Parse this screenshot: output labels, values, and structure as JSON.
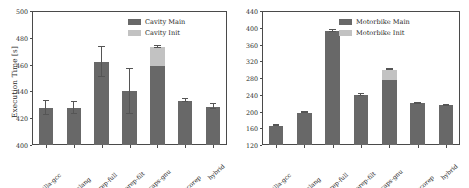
{
  "figure": {
    "panels": [
      {
        "id": "cavity",
        "ylabel": "Execution Time [s]",
        "legend": [
          {
            "label": "Cavity Main",
            "color": "#686868",
            "icon": "legend-swatch-main"
          },
          {
            "label": "Cavity Init",
            "color": "#c2c2c2",
            "icon": "legend-swatch-init"
          }
        ],
        "chart_data": {
          "type": "bar",
          "title": "",
          "xlabel": "",
          "ylabel": "Execution Time [s]",
          "ylim": [
            400,
            500
          ],
          "yticks": [
            400,
            420,
            440,
            460,
            480,
            500
          ],
          "grid": false,
          "legend_position": "upper right",
          "stacked": true,
          "categories": [
            "vanilla-gcc",
            "vanilla-clang",
            "scorep-full",
            "scorep-filt",
            "caps-gnu",
            "caps-scorep",
            "hybrid"
          ],
          "series": [
            {
              "name": "Cavity Main",
              "color": "#686868",
              "values": [
                427.5,
                427.5,
                462.0,
                440.0,
                458.8,
                433.2,
                428.6
              ],
              "errors": [
                5.0,
                4.5,
                11.0,
                16.5,
                0.0,
                0.8,
                2.0
              ]
            },
            {
              "name": "Cavity Init",
              "color": "#c2c2c2",
              "values": [
                0,
                0,
                0,
                0,
                14.5,
                0,
                0
              ],
              "errors": [
                0,
                0,
                0,
                0,
                0.7,
                0,
                0
              ]
            }
          ],
          "totals": [
            427.5,
            427.5,
            462.0,
            440.0,
            473.3,
            433.2,
            428.6
          ]
        }
      },
      {
        "id": "motorbike",
        "ylabel": "",
        "legend": [
          {
            "label": "Motorbike Main",
            "color": "#686868",
            "icon": "legend-swatch-main"
          },
          {
            "label": "Motorbike Init",
            "color": "#c2c2c2",
            "icon": "legend-swatch-init"
          }
        ],
        "chart_data": {
          "type": "bar",
          "title": "",
          "xlabel": "",
          "ylabel": "",
          "ylim": [
            120,
            440
          ],
          "yticks": [
            120,
            160,
            200,
            240,
            280,
            320,
            360,
            400,
            440
          ],
          "grid": false,
          "legend_position": "upper right",
          "stacked": true,
          "categories": [
            "vanilla-gcc",
            "vanilla-clang",
            "scorep-full",
            "scorep-filt",
            "caps-gnu",
            "caps-scorep",
            "hybrid"
          ],
          "series": [
            {
              "name": "Motorbike Main",
              "color": "#686868",
              "values": [
                166.0,
                197.5,
                392.5,
                239.0,
                276.0,
                220.0,
                215.0
              ],
              "errors": [
                1.5,
                1.5,
                2.0,
                2.0,
                0.0,
                1.5,
                1.5
              ]
            },
            {
              "name": "Motorbike Init",
              "color": "#c2c2c2",
              "values": [
                0,
                0,
                0,
                0,
                24.0,
                0,
                0
              ],
              "errors": [
                0,
                0,
                0,
                0,
                1.5,
                0,
                0
              ]
            }
          ],
          "totals": [
            166.0,
            197.5,
            392.5,
            239.0,
            300.0,
            220.0,
            215.0
          ]
        }
      }
    ]
  }
}
